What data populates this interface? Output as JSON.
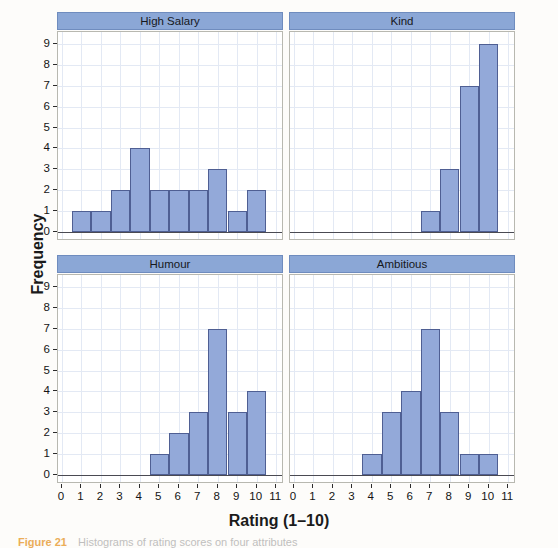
{
  "figure": {
    "xlabel": "Rating (1–10)",
    "ylabel": "Frequency",
    "caption_figno": "Figure 21",
    "caption_text": "Histograms of rating scores on four attributes",
    "strip_color": "#8ba7d6",
    "bar_fill": "#93a9d9",
    "bar_stroke": "#4f5f93",
    "grid_color": "#e3e9f4",
    "panel_border": "#b8b8b0"
  },
  "axes": {
    "y_ticks": [
      0,
      1,
      2,
      3,
      4,
      5,
      6,
      7,
      8,
      9
    ],
    "x_ticks": [
      0,
      1,
      2,
      3,
      4,
      5,
      6,
      7,
      8,
      9,
      10,
      11
    ],
    "xlim": [
      -0.2,
      11.4
    ],
    "ylim": [
      -0.45,
      9.6
    ]
  },
  "chart_data": {
    "type": "bar",
    "title": "",
    "subtitle": "",
    "xlabel": "Rating (1–10)",
    "ylabel": "Frequency",
    "grid": true,
    "legend": "none",
    "layout": "2x2 trellis of histograms, shared axes",
    "bin_width": 1,
    "xlim": [
      -0.2,
      11.4
    ],
    "ylim": [
      0,
      9.6
    ],
    "x_tick_labels": [
      "0",
      "1",
      "2",
      "3",
      "4",
      "5",
      "6",
      "7",
      "8",
      "9",
      "10",
      "11"
    ],
    "y_tick_labels": [
      "0",
      "1",
      "2",
      "3",
      "4",
      "5",
      "6",
      "7",
      "8",
      "9"
    ],
    "panels": [
      {
        "label": "High Salary",
        "position": "top-left",
        "categories": [
          1,
          2,
          3,
          4,
          5,
          6,
          7,
          8,
          9,
          10
        ],
        "values": [
          1,
          1,
          2,
          4,
          2,
          2,
          2,
          3,
          1,
          2
        ]
      },
      {
        "label": "Kind",
        "position": "top-right",
        "categories": [
          7,
          8,
          9,
          10
        ],
        "values": [
          1,
          3,
          7,
          9
        ]
      },
      {
        "label": "Humour",
        "position": "bottom-left",
        "categories": [
          5,
          6,
          7,
          8,
          9,
          10
        ],
        "values": [
          1,
          2,
          3,
          7,
          3,
          4
        ]
      },
      {
        "label": "Ambitious",
        "position": "bottom-right",
        "categories": [
          4,
          5,
          6,
          7,
          8,
          9,
          10
        ],
        "values": [
          1,
          3,
          4,
          7,
          3,
          1,
          1
        ]
      }
    ]
  }
}
